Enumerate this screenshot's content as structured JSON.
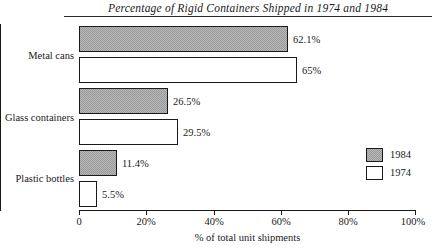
{
  "chart_data": {
    "type": "bar",
    "orientation": "horizontal",
    "title": "Percentage of Rigid Containers Shipped in 1974 and 1984",
    "xlabel": "% of total unit shipments",
    "ylabel": "",
    "xlim": [
      0,
      100
    ],
    "xticks": [
      "0",
      "20%",
      "40%",
      "60%",
      "80%",
      "100%"
    ],
    "xtick_values": [
      0,
      20,
      40,
      60,
      80,
      100
    ],
    "grid": false,
    "legend_position": "right-middle",
    "categories": [
      "Metal cans",
      "Glass containers",
      "Plastic bottles"
    ],
    "series": [
      {
        "name": "1984",
        "values": [
          62.1,
          26.5,
          11.4
        ],
        "labels": [
          "62.1%",
          "26.5%",
          "11.4%"
        ],
        "color": "#b8b8b8",
        "pattern": "checkered-gray"
      },
      {
        "name": "1974",
        "values": [
          65,
          29.5,
          5.5
        ],
        "labels": [
          "65%",
          "29.5%",
          "5.5%"
        ],
        "color": "#ffffff",
        "pattern": "solid-white"
      }
    ]
  },
  "legend": {
    "entries": [
      {
        "label": "1984"
      },
      {
        "label": "1974"
      }
    ]
  }
}
